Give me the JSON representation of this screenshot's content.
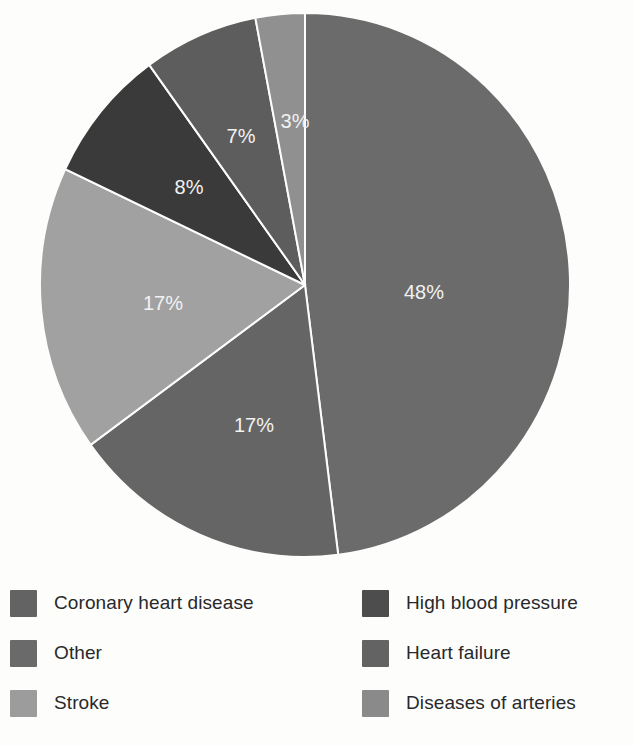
{
  "chart_data": {
    "type": "pie",
    "title": "",
    "subtitle": "",
    "xlabel": "",
    "ylabel": "",
    "legend_position": "bottom",
    "grid": false,
    "start_angle_deg": 0,
    "direction": "clockwise",
    "unit": "%",
    "categories": [
      "Coronary heart disease",
      "Other",
      "Stroke",
      "High blood pressure",
      "Heart failure",
      "Diseases of arteries"
    ],
    "values": [
      48,
      17,
      17,
      8,
      7,
      3
    ],
    "slices": [
      {
        "label": "Coronary heart disease",
        "value": 48,
        "data_label": "48%",
        "color": "#6b6b6b",
        "label_x": 424,
        "label_y": 299
      },
      {
        "label": "Other",
        "value": 17,
        "data_label": "17%",
        "color": "#656565",
        "label_x": 254,
        "label_y": 432
      },
      {
        "label": "Stroke",
        "value": 17,
        "data_label": "17%",
        "color": "#a1a1a1",
        "label_x": 163,
        "label_y": 310
      },
      {
        "label": "High blood pressure",
        "value": 8,
        "data_label": "8%",
        "color": "#3a3a3a",
        "label_x": 189,
        "label_y": 194
      },
      {
        "label": "Heart failure",
        "value": 7,
        "data_label": "7%",
        "color": "#5d5d5d",
        "label_x": 241,
        "label_y": 143
      },
      {
        "label": "Diseases of arteries",
        "value": 3,
        "data_label": "3%",
        "color": "#909090",
        "label_x": 295,
        "label_y": 128
      }
    ],
    "data_label_color": "#f2f2f2",
    "background_color": "#fdfdfc"
  },
  "legend": {
    "columns": [
      {
        "items": [
          {
            "label": "Coronary heart disease",
            "color": "#636363"
          },
          {
            "label": "Other",
            "color": "#6a6a6a"
          },
          {
            "label": "Stroke",
            "color": "#9c9c9c"
          }
        ]
      },
      {
        "items": [
          {
            "label": "High blood pressure",
            "color": "#4d4d4d"
          },
          {
            "label": "Heart failure",
            "color": "#636363"
          },
          {
            "label": "Diseases of arteries",
            "color": "#8a8a8a"
          }
        ]
      }
    ]
  }
}
